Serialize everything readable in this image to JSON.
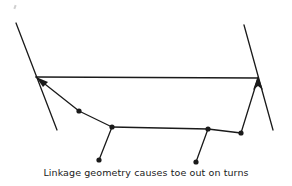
{
  "diagram": {
    "caption": "Linkage geometry causes toe out on turns",
    "stroke_color": "#1a1a1a",
    "background": "#ffffff",
    "wheels": [
      {
        "name": "left-wheel-line",
        "x1": 16,
        "y1": 23,
        "x2": 57,
        "y2": 130
      },
      {
        "name": "right-wheel-line",
        "x1": 244,
        "y1": 25,
        "x2": 273,
        "y2": 130
      }
    ],
    "tie_rod": {
      "x1": 36,
      "y1": 77,
      "x2": 258,
      "y2": 78
    },
    "linkage_path": [
      [
        36,
        77
      ],
      [
        79,
        111
      ],
      [
        112,
        127
      ],
      [
        208,
        129
      ],
      [
        241,
        133
      ],
      [
        258,
        78
      ]
    ],
    "pitman_arms": [
      {
        "from": [
          112,
          127
        ],
        "to": [
          99,
          160
        ]
      },
      {
        "from": [
          208,
          129
        ],
        "to": [
          196,
          162
        ]
      }
    ],
    "pivot_dots": [
      [
        79,
        111
      ],
      [
        112,
        127
      ],
      [
        208,
        129
      ],
      [
        241,
        133
      ],
      [
        99,
        160
      ],
      [
        196,
        162
      ]
    ]
  }
}
